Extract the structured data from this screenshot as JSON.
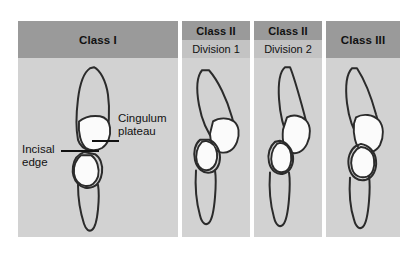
{
  "figure": {
    "background_color": "#ffffff",
    "header_color": "#9a9a9a",
    "subheader_color": "#c3c3c3",
    "panel_color": "#d2d2d2",
    "outline_color": "#2b2b2b",
    "highlight_color": "#fbfbfb"
  },
  "columns": [
    {
      "id": "class-1",
      "header": "Class I",
      "subheader": null,
      "annotations": [
        {
          "id": "cingulum-plateau",
          "line1": "Cingulum",
          "line2": "plateau"
        },
        {
          "id": "incisal-edge",
          "line1": "Incisal",
          "line2": "edge"
        }
      ]
    },
    {
      "id": "class-2-division-1",
      "header": "Class II",
      "subheader": "Division 1",
      "annotations": []
    },
    {
      "id": "class-2-division-2",
      "header": "Class II",
      "subheader": "Division 2",
      "annotations": []
    },
    {
      "id": "class-3",
      "header": "Class III",
      "subheader": null,
      "annotations": []
    }
  ]
}
